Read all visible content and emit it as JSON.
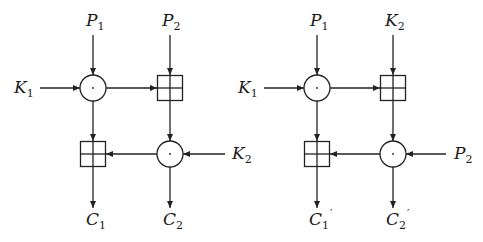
{
  "diagrams": [
    {
      "name": "left",
      "top_inputs": [
        {
          "base": "P",
          "sub": "1",
          "prime": ""
        },
        {
          "base": "P",
          "sub": "2",
          "prime": ""
        }
      ],
      "left_input": {
        "base": "K",
        "sub": "1",
        "prime": ""
      },
      "right_input": {
        "base": "K",
        "sub": "2",
        "prime": ""
      },
      "outputs": [
        {
          "base": "C",
          "sub": "1",
          "prime": ""
        },
        {
          "base": "C",
          "sub": "2",
          "prime": ""
        }
      ]
    },
    {
      "name": "right",
      "top_inputs": [
        {
          "base": "P",
          "sub": "1",
          "prime": ""
        },
        {
          "base": "K",
          "sub": "2",
          "prime": ""
        }
      ],
      "left_input": {
        "base": "K",
        "sub": "1",
        "prime": ""
      },
      "right_input": {
        "base": "P",
        "sub": "2",
        "prime": ""
      },
      "outputs": [
        {
          "base": "C",
          "sub": "1",
          "prime": "′"
        },
        {
          "base": "C",
          "sub": "2",
          "prime": "′"
        }
      ]
    }
  ],
  "operators": {
    "multiply": "circle-dot (modular multiplication)",
    "add": "boxed-plus (modular addition)"
  }
}
